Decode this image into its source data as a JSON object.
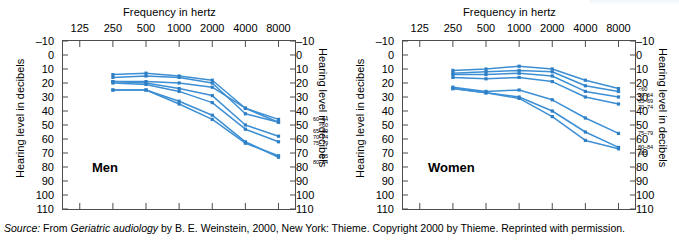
{
  "figure": {
    "caption_source_label": "Source:",
    "caption_text_1": " From ",
    "caption_title": "Geriatric audiology",
    "caption_text_2": " by B. E. Weinstein, 2000, New York: Thieme. Copyright 2000 by Thieme. Reprinted with permission."
  },
  "panels": [
    {
      "name": "Men",
      "xlabel": "Frequency in hertz",
      "ylabel_left": "Hearing level in decibels",
      "ylabel_right": "Hearing level in decibels"
    },
    {
      "name": "Women",
      "xlabel": "Frequency in hertz",
      "ylabel_left": "Hearing level in decibels",
      "ylabel_right": "Hearing level in decibels"
    }
  ],
  "chart_data": [
    {
      "type": "line",
      "title": "Men",
      "xlabel": "Frequency in hertz",
      "ylabel": "Hearing level in decibels",
      "x_scale": "log",
      "categories": [
        125,
        250,
        500,
        1000,
        2000,
        4000,
        8000
      ],
      "xticklabels": [
        "125",
        "250",
        "500",
        "1000",
        "2000",
        "4000",
        "8000"
      ],
      "xlim": [
        88,
        11300
      ],
      "ylim": [
        -10,
        110
      ],
      "y_inverted": true,
      "yticks": [
        -10,
        0,
        10,
        20,
        30,
        40,
        50,
        60,
        70,
        80,
        90,
        100,
        110
      ],
      "yticklabels": [
        "–10",
        "0",
        "10",
        "20",
        "30",
        "40",
        "50",
        "60",
        "70",
        "80",
        "90",
        "100",
        "110"
      ],
      "grid": false,
      "legend_position": "right-inline",
      "series": [
        {
          "name": "<60",
          "x": [
            250,
            500,
            1000,
            2000,
            4000,
            8000
          ],
          "values": [
            19,
            19,
            20,
            23,
            38,
            48
          ]
        },
        {
          "name": "60–64",
          "x": [
            250,
            500,
            1000,
            2000,
            4000,
            8000
          ],
          "values": [
            14,
            13,
            15,
            18,
            38,
            46
          ]
        },
        {
          "name": "65–69",
          "x": [
            250,
            500,
            1000,
            2000,
            4000,
            8000
          ],
          "values": [
            16,
            15,
            16,
            20,
            42,
            48
          ]
        },
        {
          "name": "70–74",
          "x": [
            250,
            500,
            1000,
            2000,
            4000,
            8000
          ],
          "values": [
            19,
            20,
            24,
            29,
            50,
            58
          ]
        },
        {
          "name": "75–79",
          "x": [
            250,
            500,
            1000,
            2000,
            4000,
            8000
          ],
          "values": [
            20,
            21,
            26,
            34,
            53,
            62
          ]
        },
        {
          "name": "80–84",
          "x": [
            250,
            500,
            1000,
            2000,
            4000,
            8000
          ],
          "values": [
            25,
            25,
            33,
            43,
            62,
            73
          ]
        },
        {
          "name": "≥85",
          "x": [
            250,
            500,
            1000,
            2000,
            4000,
            8000
          ],
          "values": [
            25,
            25,
            35,
            46,
            63,
            72
          ]
        }
      ]
    },
    {
      "type": "line",
      "title": "Women",
      "xlabel": "Frequency in hertz",
      "ylabel": "Hearing level in decibels",
      "x_scale": "log",
      "categories": [
        125,
        250,
        500,
        1000,
        2000,
        4000,
        8000
      ],
      "xticklabels": [
        "125",
        "250",
        "500",
        "1000",
        "2000",
        "4000",
        "8000"
      ],
      "xlim": [
        88,
        11300
      ],
      "ylim": [
        -10,
        110
      ],
      "y_inverted": true,
      "yticks": [
        -10,
        0,
        10,
        20,
        30,
        40,
        50,
        60,
        70,
        80,
        90,
        100,
        110
      ],
      "yticklabels": [
        "–10",
        "0",
        "10",
        "20",
        "30",
        "40",
        "50",
        "60",
        "70",
        "80",
        "90",
        "100",
        "110"
      ],
      "grid": false,
      "legend_position": "right-inline",
      "series": [
        {
          "name": "<60",
          "x": [
            250,
            500,
            1000,
            2000,
            4000,
            8000
          ],
          "values": [
            11,
            10,
            8,
            10,
            18,
            24
          ]
        },
        {
          "name": "60–64",
          "x": [
            250,
            500,
            1000,
            2000,
            4000,
            8000
          ],
          "values": [
            13,
            12,
            11,
            12,
            22,
            26
          ]
        },
        {
          "name": "65–69",
          "x": [
            250,
            500,
            1000,
            2000,
            4000,
            8000
          ],
          "values": [
            14,
            14,
            13,
            15,
            26,
            30
          ]
        },
        {
          "name": "70–74",
          "x": [
            250,
            500,
            1000,
            2000,
            4000,
            8000
          ],
          "values": [
            16,
            17,
            16,
            19,
            30,
            35
          ]
        },
        {
          "name": "75–79",
          "x": [
            250,
            500,
            1000,
            2000,
            4000,
            8000
          ],
          "values": [
            23,
            26,
            25,
            32,
            45,
            56
          ]
        },
        {
          "name": "80–84",
          "x": [
            250,
            500,
            1000,
            2000,
            4000,
            8000
          ],
          "values": [
            24,
            27,
            30,
            40,
            55,
            66
          ]
        },
        {
          "name": "≥85",
          "x": [
            250,
            500,
            1000,
            2000,
            4000,
            8000
          ],
          "values": [
            24,
            27,
            31,
            44,
            61,
            67
          ]
        }
      ]
    }
  ],
  "style": {
    "line_color": "#3d8fd4",
    "marker_color": "#2f7fc4",
    "axis_color": "#4d4d4d",
    "text_color": "#000000"
  }
}
